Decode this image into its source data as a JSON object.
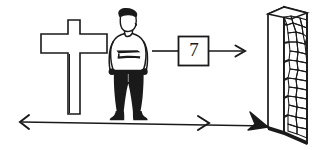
{
  "figure": {
    "style": "black ink line drawing on white background",
    "background_color": "#ffffff",
    "ink_color": "#1a1a1a"
  },
  "elements": {
    "cross": {
      "name": "cross-monument",
      "label": "",
      "description": "Upright Latin cross with outlined body and shaded lower-right edges"
    },
    "person": {
      "name": "standing-person",
      "label": "",
      "description": "Standing man facing forward, dark hair, light shirt with dark band across chest, dark trousers and shoes"
    },
    "box": {
      "name": "value-box",
      "value": "7",
      "description": "Square box containing the number seven, with an input line on the left and an output arrow on the right"
    },
    "wall": {
      "name": "stone-wall",
      "label": "",
      "description": "Tall stone wall drawn in perspective, filled with irregular rubble stones"
    }
  },
  "connectors": {
    "person_to_box": {
      "name": "person-to-box-line",
      "label": "",
      "type": "line"
    },
    "box_to_wall": {
      "name": "box-to-wall-arrow",
      "label": "",
      "type": "arrow-right"
    },
    "baseline": {
      "name": "ground-measurement-line",
      "label": "",
      "type": "double-headed-arrow",
      "left_arrow": "arrow-left",
      "mid_arrow": "arrow-right",
      "end_arrow": "bold-arrow-to-wall"
    }
  },
  "colors": {
    "ink": "#1a1a1a",
    "paper": "#ffffff",
    "shade": "#000000"
  }
}
